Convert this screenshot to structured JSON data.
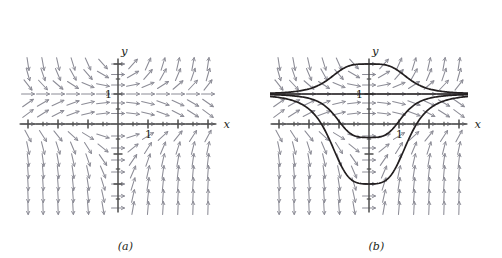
{
  "figure": {
    "title": "",
    "background_color": "#ffffff",
    "width": 502,
    "height": 258
  },
  "panels": [
    {
      "id": "a",
      "caption": "(a)",
      "axis_labels": {
        "x": "x",
        "y": "y"
      },
      "tick_labels": {
        "x_one": "1",
        "y_one": "1"
      },
      "has_solution_curves": false,
      "colors": {
        "axis": "#4d4d4d",
        "arrow": "#8c8c96",
        "curve": "#231f20"
      }
    },
    {
      "id": "b",
      "caption": "(b)",
      "axis_labels": {
        "x": "x",
        "y": "y"
      },
      "tick_labels": {
        "x_one": "1",
        "y_one": "1"
      },
      "has_solution_curves": true,
      "colors": {
        "axis": "#4d4d4d",
        "arrow": "#8c8c96",
        "curve": "#231f20"
      }
    }
  ],
  "chart_data": {
    "type": "line",
    "xlabel": "x",
    "ylabel": "y",
    "xlim": [
      -3.4,
      3.4
    ],
    "ylim": [
      -3.1,
      2.3
    ],
    "grid": false,
    "legend_position": "none",
    "axis_tick_labels": {
      "x": [
        "1"
      ],
      "y": [
        "1"
      ]
    },
    "annotations": [
      "(a)",
      "(b)",
      "x",
      "y",
      "1",
      "1"
    ],
    "field": {
      "description": "Slope field of dy/dx = 2x*y*(y-1); arrows drawn on a 13 x 13 lattice",
      "equation": "dy/dx = 2*x*y*(y - 1)",
      "x_samples": [
        -3.0,
        -2.5,
        -2.0,
        -1.5,
        -1.0,
        -0.5,
        0.0,
        0.5,
        1.0,
        1.5,
        2.0,
        2.5,
        3.0
      ],
      "y_samples": [
        2.0,
        1.65,
        1.3,
        1.0,
        0.7,
        0.35,
        0.0,
        -0.4,
        -0.8,
        -1.2,
        -1.6,
        -2.0,
        -2.4,
        -2.8
      ]
    },
    "series": [
      {
        "name": "equilibrium y = 1",
        "type": "horizontal-asymptote",
        "value": 1.0,
        "x": [
          -3.4,
          3.4
        ],
        "values": [
          1.0,
          1.0
        ]
      },
      {
        "name": "bell curve above y = 1",
        "peak": {
          "x": 0.0,
          "y": 2.0
        },
        "asymptote": 1.0,
        "formula": "y = 1 + 1/(1 + 0.55*x^2*x^2)"
      },
      {
        "name": "curve below y = 1, minimum at origin side",
        "minimum": {
          "x": 0.0,
          "y": -0.45
        },
        "asymptote": 1.0,
        "formula": "y = 1 - 1.45/(1 + 0.25*x^4)"
      },
      {
        "name": "deep curve below, minimum near y = -2",
        "minimum": {
          "x": 0.0,
          "y": -2.0
        },
        "asymptote": 1.0,
        "formula": "y = 1 - 3.0/(1 + 0.12*x^4)"
      }
    ]
  }
}
